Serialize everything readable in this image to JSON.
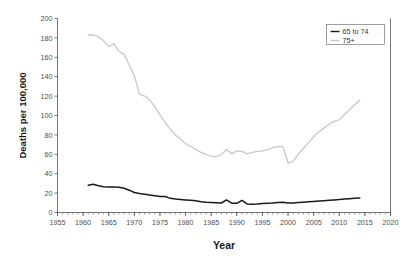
{
  "chart_data": {
    "type": "line",
    "title": "",
    "xlabel": "Year",
    "ylabel": "Deaths per 100,000",
    "xlim": [
      1955,
      2020
    ],
    "ylim": [
      0,
      200
    ],
    "xticks": [
      1955,
      1960,
      1965,
      1970,
      1975,
      1980,
      1985,
      1990,
      1995,
      2000,
      2005,
      2010,
      2015,
      2020
    ],
    "yticks": [
      0,
      20,
      40,
      60,
      80,
      100,
      120,
      140,
      160,
      180,
      200
    ],
    "xtick_labels": [
      "1955",
      "1960",
      "1965",
      "1970",
      "1975",
      "1980",
      "1985",
      "1990",
      "1995",
      "2000",
      "2005",
      "2010",
      "2015",
      "2020"
    ],
    "ytick_labels": [
      "0",
      "20",
      "40",
      "60",
      "80",
      "100",
      "120",
      "140",
      "160",
      "180",
      "200"
    ],
    "minor_xtick_interval": 1,
    "grid": false,
    "legend_position": "top-right",
    "series": [
      {
        "name": "65 to 74",
        "color": "#1a1a1a",
        "x": [
          1961,
          1962,
          1963,
          1964,
          1965,
          1966,
          1967,
          1968,
          1969,
          1970,
          1971,
          1972,
          1973,
          1974,
          1975,
          1976,
          1977,
          1978,
          1979,
          1980,
          1981,
          1982,
          1983,
          1984,
          1985,
          1986,
          1987,
          1988,
          1989,
          1990,
          1991,
          1992,
          1993,
          1994,
          1995,
          1996,
          1997,
          1998,
          1999,
          2000,
          2001,
          2002,
          2003,
          2004,
          2005,
          2006,
          2007,
          2008,
          2009,
          2010,
          2011,
          2012,
          2013,
          2014
        ],
        "values": [
          28.0,
          29.2,
          27.5,
          26.6,
          26.3,
          26.4,
          26.0,
          25.0,
          23.0,
          20.6,
          19.6,
          18.8,
          18.0,
          17.2,
          16.4,
          16.5,
          14.6,
          13.8,
          13.4,
          13.0,
          12.6,
          12.1,
          11.0,
          10.6,
          10.4,
          10.1,
          9.8,
          13.0,
          9.6,
          9.5,
          12.6,
          8.8,
          8.6,
          8.8,
          9.2,
          9.5,
          9.8,
          10.4,
          10.5,
          9.7,
          9.8,
          10.2,
          10.6,
          11.0,
          11.4,
          11.8,
          12.2,
          12.6,
          13.0,
          13.3,
          13.8,
          14.2,
          14.6,
          15.0
        ]
      },
      {
        "name": "75+",
        "color": "#c8c8c8",
        "x": [
          1961,
          1962,
          1963,
          1964,
          1965,
          1966,
          1967,
          1968,
          1969,
          1970,
          1971,
          1972,
          1973,
          1974,
          1975,
          1976,
          1977,
          1978,
          1979,
          1980,
          1981,
          1982,
          1983,
          1984,
          1985,
          1986,
          1987,
          1988,
          1989,
          1990,
          1991,
          1992,
          1993,
          1994,
          1995,
          1996,
          1997,
          1998,
          1999,
          2000,
          2001,
          2002,
          2003,
          2004,
          2005,
          2006,
          2007,
          2008,
          2009,
          2010,
          2011,
          2012,
          2013,
          2014
        ],
        "values": [
          183.0,
          183.0,
          181.0,
          177.0,
          171.0,
          174.0,
          166.0,
          163.0,
          152.0,
          141.0,
          122.0,
          120.0,
          116.0,
          109.0,
          101.0,
          93.0,
          86.0,
          80.0,
          76.0,
          71.0,
          68.0,
          65.0,
          62.0,
          60.0,
          58.0,
          57.5,
          60.0,
          65.0,
          60.5,
          63.5,
          63.0,
          60.5,
          62.0,
          63.0,
          63.5,
          64.5,
          67.0,
          68.0,
          68.0,
          51.0,
          53.0,
          60.0,
          66.0,
          72.0,
          78.0,
          83.0,
          87.0,
          91.0,
          94.0,
          95.5,
          101.0,
          106.0,
          111.0,
          116.0
        ]
      }
    ]
  },
  "legend": {
    "entries": [
      {
        "label": "65 to 74",
        "color": "#1a1a1a"
      },
      {
        "label": "75+",
        "color": "#c8c8c8"
      }
    ]
  },
  "axes": {
    "x_title": "Year",
    "y_title": "Deaths per 100,000"
  }
}
